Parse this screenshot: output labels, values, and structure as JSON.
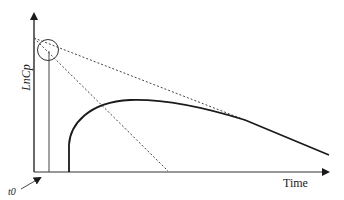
{
  "diagram": {
    "type": "pharmacokinetic log-concentration vs time curve",
    "y_axis_label": "LnCp",
    "x_axis_label": "Time",
    "start_marker_label": "t0",
    "colors": {
      "axis": "#1a1a1a",
      "curve": "#1a1a1a",
      "dashed": "#444444",
      "circle": "#333333"
    },
    "elements": [
      {
        "name": "y-axis",
        "description": "vertical axis with arrow at top"
      },
      {
        "name": "x-axis",
        "description": "horizontal axis with arrow at right"
      },
      {
        "name": "sample-line",
        "description": "vertical line at early time from x-axis to circled intercept"
      },
      {
        "name": "concentration-curve",
        "description": "solid curve rising from lag time to peak then declining linearly"
      },
      {
        "name": "terminal-extrapolation",
        "description": "shallow dashed line extrapolating terminal phase back to y-axis"
      },
      {
        "name": "absorption-residual-line",
        "description": "steep dashed line from y-axis intercept to x-axis"
      },
      {
        "name": "intercept-circle",
        "description": "circle highlighting intersection near y-axis"
      },
      {
        "name": "t0-arrow",
        "description": "arrow pointing to origin labeled t0"
      }
    ]
  }
}
